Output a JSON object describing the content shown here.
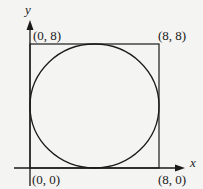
{
  "diagram": {
    "axes": {
      "x_label": "x",
      "y_label": "y"
    },
    "points": [
      {
        "id": "origin",
        "label": "(0, 0)"
      },
      {
        "id": "bottom-right",
        "label": "(8, 0)"
      },
      {
        "id": "top-left",
        "label": "(0, 8)"
      },
      {
        "id": "top-right",
        "label": "(8, 8)"
      }
    ],
    "shapes": {
      "square": {
        "corners": [
          "(0, 0)",
          "(8, 0)",
          "(8, 8)",
          "(0, 8)"
        ]
      },
      "circle": {
        "inscribed_in": "square",
        "center": "(4, 4)",
        "radius": 4
      }
    },
    "colors": {
      "stroke": "#1a1a1a",
      "background": "#f4f4f2"
    }
  }
}
